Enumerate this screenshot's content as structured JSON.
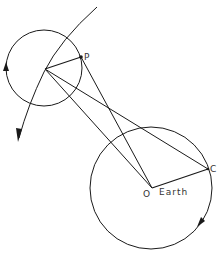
{
  "diagram": {
    "type": "geometry",
    "colors": {
      "line": "#1a1a1a",
      "label": "#333333",
      "background": "#ffffff"
    },
    "labels": {
      "p": "P",
      "c": "C",
      "o": "O",
      "earth": "Earth"
    },
    "points": {
      "moon_center": [
        45,
        69
      ],
      "P": [
        81,
        57
      ],
      "O": [
        152,
        188
      ],
      "C": [
        208,
        169
      ]
    },
    "circles": [
      {
        "name": "moon-circle",
        "cx": 44,
        "cy": 68,
        "r": 38,
        "arrow": "up-on-left"
      },
      {
        "name": "earth-circle",
        "cx": 151,
        "cy": 188,
        "r": 61,
        "arrow": "down-on-right"
      }
    ],
    "orbit_arc": {
      "from": [
        97,
        7
      ],
      "to": [
        18,
        142
      ],
      "arrow": "end"
    }
  }
}
